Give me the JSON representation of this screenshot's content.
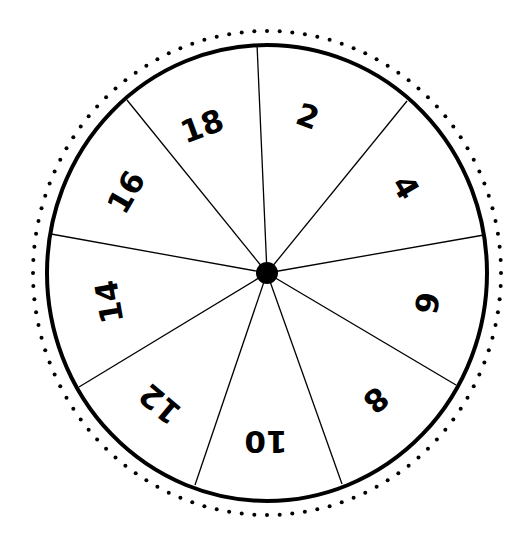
{
  "wheel": {
    "center": [
      267,
      273
    ],
    "rx": 220,
    "ry": 228,
    "dot_rx": 234,
    "dot_ry": 242,
    "dot_count": 116,
    "hub_radius": 11,
    "colors": {
      "line": "#000000",
      "background": "#ffffff"
    },
    "dividers": [
      [
        257,
        44
      ],
      [
        407,
        101
      ],
      [
        484,
        235
      ],
      [
        456,
        385
      ],
      [
        342,
        484
      ],
      [
        195,
        485
      ],
      [
        79,
        387
      ],
      [
        51,
        234
      ],
      [
        127,
        100
      ]
    ],
    "segments": [
      {
        "label": "2",
        "x": 308,
        "y": 116,
        "rotate": 20
      },
      {
        "label": "4",
        "x": 406,
        "y": 187,
        "rotate": 60
      },
      {
        "label": "6",
        "x": 427,
        "y": 303,
        "rotate": 100
      },
      {
        "label": "8",
        "x": 376,
        "y": 400,
        "rotate": 140
      },
      {
        "label": "10",
        "x": 266,
        "y": 442,
        "rotate": 180
      },
      {
        "label": "12",
        "x": 160,
        "y": 404,
        "rotate": 220
      },
      {
        "label": "14",
        "x": 109,
        "y": 302,
        "rotate": 260
      },
      {
        "label": "16",
        "x": 126,
        "y": 192,
        "rotate": 300
      },
      {
        "label": "18",
        "x": 202,
        "y": 126,
        "rotate": 340
      }
    ]
  }
}
